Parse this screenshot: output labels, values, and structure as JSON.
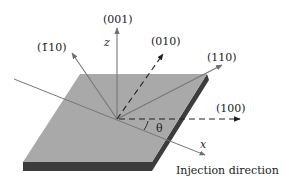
{
  "diagram": {
    "type": "crystal orientation schematic",
    "plate": {
      "top_color": "#a9a9a9",
      "edge_color": "#3c3c3c"
    },
    "axes": {
      "z_label": "z",
      "x_label": "x",
      "angle_label": "θ"
    },
    "directions": [
      {
        "id": "001",
        "label": "(001)",
        "style": "solid"
      },
      {
        "id": "-110",
        "label": "(1̄10)",
        "style": "solid"
      },
      {
        "id": "010",
        "label": "(010)",
        "style": "dashed"
      },
      {
        "id": "110",
        "label": "(110)",
        "style": "solid"
      },
      {
        "id": "100",
        "label": "(100)",
        "style": "dashed"
      }
    ],
    "caption": "Injection direction",
    "line_color": "#777777",
    "dash_color": "#222222"
  }
}
